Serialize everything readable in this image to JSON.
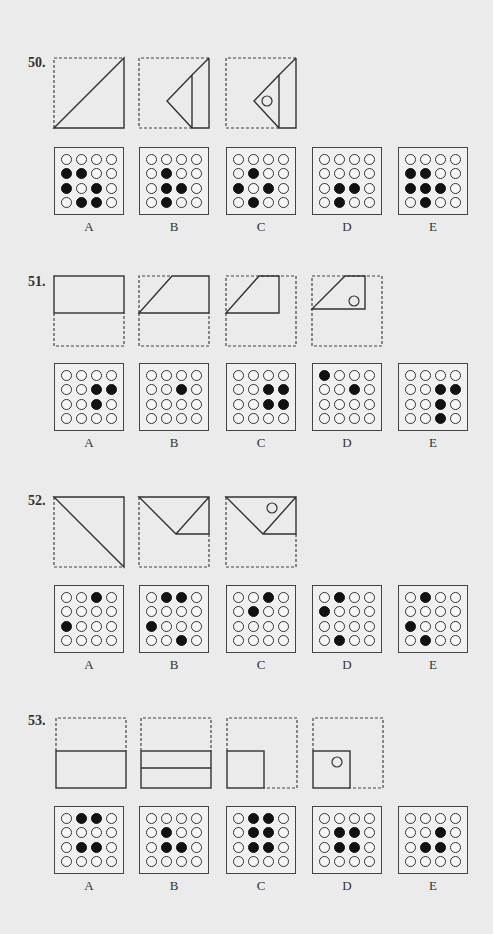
{
  "page": {
    "background": "#ebebeb"
  },
  "questions": [
    {
      "number": "50.",
      "fold_steps": 3,
      "options": [
        {
          "label": "A",
          "grid": [
            [
              0,
              0,
              0,
              0
            ],
            [
              1,
              1,
              0,
              0
            ],
            [
              1,
              0,
              1,
              0
            ],
            [
              0,
              1,
              1,
              0
            ]
          ]
        },
        {
          "label": "B",
          "grid": [
            [
              0,
              0,
              0,
              0
            ],
            [
              0,
              1,
              0,
              0
            ],
            [
              0,
              1,
              1,
              0
            ],
            [
              0,
              1,
              0,
              0
            ]
          ]
        },
        {
          "label": "C",
          "grid": [
            [
              0,
              0,
              0,
              0
            ],
            [
              0,
              1,
              0,
              0
            ],
            [
              1,
              0,
              1,
              0
            ],
            [
              0,
              1,
              0,
              0
            ]
          ]
        },
        {
          "label": "D",
          "grid": [
            [
              0,
              0,
              0,
              0
            ],
            [
              0,
              0,
              0,
              0
            ],
            [
              0,
              1,
              1,
              0
            ],
            [
              0,
              1,
              0,
              0
            ]
          ]
        },
        {
          "label": "E",
          "grid": [
            [
              0,
              0,
              0,
              0
            ],
            [
              1,
              1,
              0,
              0
            ],
            [
              1,
              1,
              1,
              0
            ],
            [
              0,
              1,
              0,
              0
            ]
          ]
        }
      ]
    },
    {
      "number": "51.",
      "fold_steps": 4,
      "options": [
        {
          "label": "A",
          "grid": [
            [
              0,
              0,
              0,
              0
            ],
            [
              0,
              0,
              1,
              1
            ],
            [
              0,
              0,
              1,
              0
            ],
            [
              0,
              0,
              0,
              0
            ]
          ]
        },
        {
          "label": "B",
          "grid": [
            [
              0,
              0,
              0,
              0
            ],
            [
              0,
              0,
              1,
              0
            ],
            [
              0,
              0,
              0,
              0
            ],
            [
              0,
              0,
              0,
              0
            ]
          ]
        },
        {
          "label": "C",
          "grid": [
            [
              0,
              0,
              0,
              0
            ],
            [
              0,
              0,
              1,
              1
            ],
            [
              0,
              0,
              1,
              1
            ],
            [
              0,
              0,
              0,
              0
            ]
          ]
        },
        {
          "label": "D",
          "grid": [
            [
              1,
              0,
              0,
              0
            ],
            [
              0,
              0,
              1,
              0
            ],
            [
              0,
              0,
              0,
              0
            ],
            [
              0,
              0,
              0,
              0
            ]
          ]
        },
        {
          "label": "E",
          "grid": [
            [
              0,
              0,
              0,
              0
            ],
            [
              0,
              0,
              1,
              1
            ],
            [
              0,
              0,
              1,
              0
            ],
            [
              0,
              0,
              1,
              0
            ]
          ]
        }
      ]
    },
    {
      "number": "52.",
      "fold_steps": 3,
      "options": [
        {
          "label": "A",
          "grid": [
            [
              0,
              0,
              1,
              0
            ],
            [
              0,
              0,
              0,
              0
            ],
            [
              1,
              0,
              0,
              0
            ],
            [
              0,
              0,
              0,
              0
            ]
          ]
        },
        {
          "label": "B",
          "grid": [
            [
              0,
              1,
              1,
              0
            ],
            [
              0,
              0,
              0,
              0
            ],
            [
              1,
              0,
              0,
              0
            ],
            [
              0,
              0,
              1,
              0
            ]
          ]
        },
        {
          "label": "C",
          "grid": [
            [
              0,
              0,
              1,
              0
            ],
            [
              0,
              1,
              0,
              0
            ],
            [
              0,
              0,
              0,
              0
            ],
            [
              0,
              0,
              0,
              0
            ]
          ]
        },
        {
          "label": "D",
          "grid": [
            [
              0,
              1,
              0,
              0
            ],
            [
              1,
              0,
              0,
              0
            ],
            [
              0,
              0,
              0,
              0
            ],
            [
              0,
              1,
              0,
              0
            ]
          ]
        },
        {
          "label": "E",
          "grid": [
            [
              0,
              1,
              0,
              0
            ],
            [
              0,
              0,
              0,
              0
            ],
            [
              1,
              0,
              0,
              0
            ],
            [
              0,
              1,
              0,
              0
            ]
          ]
        }
      ]
    },
    {
      "number": "53.",
      "fold_steps": 4,
      "options": [
        {
          "label": "A",
          "grid": [
            [
              0,
              1,
              1,
              0
            ],
            [
              0,
              0,
              0,
              0
            ],
            [
              0,
              1,
              1,
              0
            ],
            [
              0,
              0,
              0,
              0
            ]
          ]
        },
        {
          "label": "B",
          "grid": [
            [
              0,
              0,
              0,
              0
            ],
            [
              0,
              1,
              0,
              0
            ],
            [
              0,
              1,
              1,
              0
            ],
            [
              0,
              0,
              0,
              0
            ]
          ]
        },
        {
          "label": "C",
          "grid": [
            [
              0,
              1,
              1,
              0
            ],
            [
              0,
              1,
              1,
              0
            ],
            [
              0,
              1,
              1,
              0
            ],
            [
              0,
              0,
              0,
              0
            ]
          ]
        },
        {
          "label": "D",
          "grid": [
            [
              0,
              0,
              0,
              0
            ],
            [
              0,
              1,
              1,
              0
            ],
            [
              0,
              1,
              1,
              0
            ],
            [
              0,
              0,
              0,
              0
            ]
          ]
        },
        {
          "label": "E",
          "grid": [
            [
              0,
              0,
              0,
              0
            ],
            [
              0,
              0,
              1,
              0
            ],
            [
              0,
              1,
              1,
              0
            ],
            [
              0,
              0,
              0,
              0
            ]
          ]
        }
      ]
    }
  ]
}
